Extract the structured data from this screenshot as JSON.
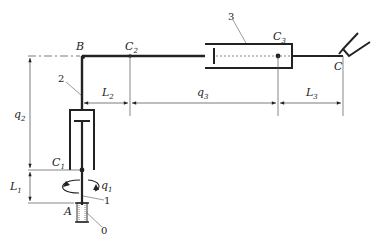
{
  "diagram": {
    "type": "cylindrical-manipulator-kinematic-scheme",
    "points": {
      "B": "B",
      "C": "C",
      "A": "A",
      "C1": {
        "base": "C",
        "sub": "1"
      },
      "C2": {
        "base": "C",
        "sub": "2"
      },
      "C3": {
        "base": "C",
        "sub": "3"
      }
    },
    "dimensions": {
      "q1": {
        "base": "q",
        "sub": "1"
      },
      "q2": {
        "base": "q",
        "sub": "2"
      },
      "q3": {
        "base": "q",
        "sub": "3"
      },
      "L1": {
        "base": "L",
        "sub": "1"
      },
      "L2": {
        "base": "L",
        "sub": "2"
      },
      "L3": {
        "base": "L",
        "sub": "3"
      }
    },
    "link_numbers": {
      "base": "0",
      "link1": "1",
      "link2": "2",
      "link3": "3"
    },
    "colors": {
      "stroke": "#222222",
      "thin": "#555555",
      "background": "#ffffff"
    }
  }
}
